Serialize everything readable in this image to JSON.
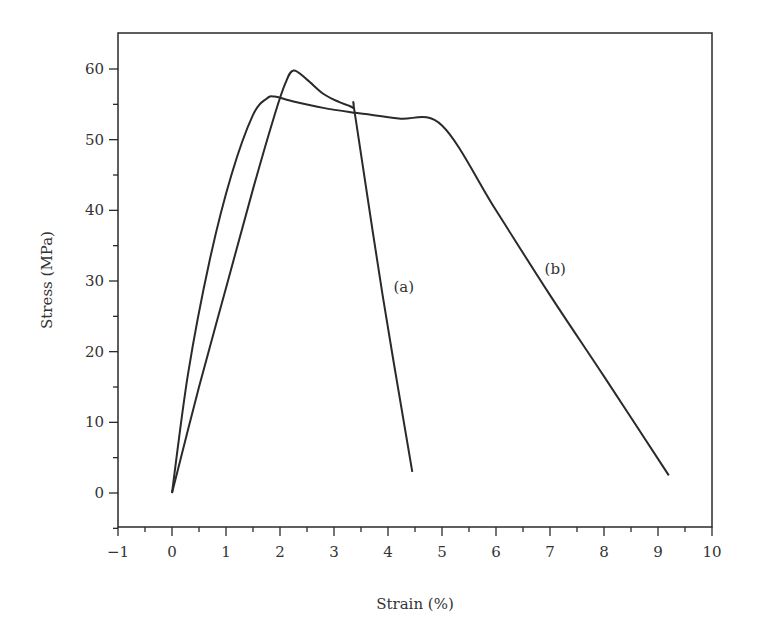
{
  "chart_data": {
    "type": "line",
    "title": "",
    "xlabel": "Strain (%)",
    "ylabel": "Stress (MPa)",
    "xlim": [
      -1,
      10
    ],
    "ylim": [
      -5,
      65
    ],
    "xticks": [
      -1,
      0,
      1,
      2,
      3,
      4,
      5,
      6,
      7,
      8,
      9,
      10
    ],
    "xtick_labels": [
      "−1",
      "0",
      "1",
      "2",
      "3",
      "4",
      "5",
      "6",
      "7",
      "8",
      "9",
      "10"
    ],
    "yticks": [
      0,
      10,
      20,
      30,
      40,
      50,
      60
    ],
    "ytick_labels": [
      "0",
      "10",
      "20",
      "30",
      "40",
      "50",
      "60"
    ],
    "grid": false,
    "legend": null,
    "series": [
      {
        "name": "(a)",
        "x": [
          0.0,
          0.5,
          1.0,
          1.5,
          1.9,
          2.1,
          2.25,
          2.5,
          2.8,
          3.1,
          3.35,
          3.4,
          3.9,
          4.45
        ],
        "y": [
          0.0,
          15.0,
          29.0,
          43.0,
          53.5,
          58.0,
          59.8,
          58.5,
          56.5,
          55.3,
          54.5,
          53.0,
          28.0,
          3.0
        ],
        "color": "#2a2a2a"
      },
      {
        "name": "(b)",
        "x": [
          0.0,
          0.3,
          0.7,
          1.1,
          1.5,
          1.75,
          1.9,
          2.2,
          2.8,
          3.4,
          4.2,
          5.0,
          6.0,
          7.0,
          8.0,
          9.2
        ],
        "y": [
          0.0,
          17.0,
          33.0,
          45.0,
          53.5,
          55.8,
          56.1,
          55.5,
          54.5,
          53.8,
          53.0,
          52.0,
          40.0,
          28.0,
          16.5,
          2.5
        ],
        "color": "#2a2a2a"
      }
    ],
    "annotations": [
      {
        "text": "(a)",
        "x": 4.1,
        "y": 28.5
      },
      {
        "text": "(b)",
        "x": 6.9,
        "y": 31.0
      }
    ]
  }
}
